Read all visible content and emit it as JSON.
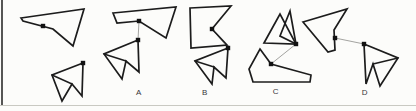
{
  "figure": {
    "background": "#fcfcfa",
    "stroke_color": "#1c1c1c",
    "connector_color": "#999995",
    "dot_color": "#121212",
    "frame": {
      "left_border_points": "2,0 2,105",
      "bottom_rule_points": "0,105.5 416,105.5"
    },
    "pairs": [
      {
        "id": "example",
        "label": "",
        "polygons": [
          {
            "name": "example-large-polygon",
            "points": "21,18 84,9 73,46 53,29 23,21"
          },
          {
            "name": "example-small-polygon",
            "points": "83,63 52,75 62,101 72,84 82,96"
          }
        ],
        "internal": "52,75 72,84",
        "dots": [
          [
            43,
            26
          ],
          [
            83,
            63
          ]
        ],
        "connector": ""
      },
      {
        "id": "option-a",
        "label": "A",
        "label_x": 139,
        "label_y": 95,
        "polygons": [
          {
            "name": "option-a-large-polygon",
            "points": "113,13 176,7 166,38 139,21 117,23"
          },
          {
            "name": "option-a-small-polygon",
            "points": "138,40 104,54 122,79 126,61 139,72"
          }
        ],
        "internal": "104,54 126,61",
        "dots": [
          [
            139,
            21
          ],
          [
            138,
            40
          ]
        ],
        "connector": "139,21 138,40"
      },
      {
        "id": "option-b",
        "label": "B",
        "label_x": 205,
        "label_y": 95,
        "polygons": [
          {
            "name": "option-b-large-polygon",
            "points": "190,8 231,6 212,29 227,45 191,48"
          },
          {
            "name": "option-b-small-polygon",
            "points": "228,48 195,61 212,84 214,67 226,78"
          }
        ],
        "internal": "195,61 214,67",
        "dots": [
          [
            212,
            29
          ],
          [
            228,
            48
          ]
        ],
        "connector": "212,29 228,48"
      },
      {
        "id": "option-c",
        "label": "C",
        "label_x": 276,
        "label_y": 94,
        "polygons": [
          {
            "name": "option-c-top-triangle-1",
            "points": "264,43 280,14 296,44"
          },
          {
            "name": "option-c-top-triangle-2",
            "points": "290,11 280,36 296,44"
          },
          {
            "name": "option-c-bottom-polygon",
            "points": "260,49 271,64 311,75 310,82 253,82 249,69"
          }
        ],
        "internal": "",
        "dots": [
          [
            296,
            44
          ],
          [
            271,
            64
          ]
        ],
        "connector": "271,64 296,44"
      },
      {
        "id": "option-d",
        "label": "D",
        "label_x": 365,
        "label_y": 95,
        "polygons": [
          {
            "name": "option-d-large-polygon",
            "points": "303,22 347,9 334,30 335,50 328,52"
          },
          {
            "name": "option-d-small-polygon",
            "points": "364,44 398,58 380,86 373,64 366,84"
          }
        ],
        "internal": "398,58 373,64",
        "dots": [
          [
            335,
            38
          ],
          [
            364,
            44
          ]
        ],
        "connector": "335,38 364,44"
      }
    ]
  }
}
